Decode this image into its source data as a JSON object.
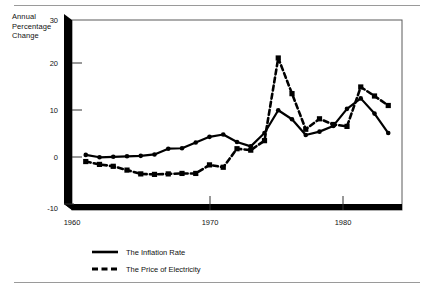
{
  "figure": {
    "axis_title_lines": [
      "Annual",
      "Percentage",
      "Change"
    ],
    "rule_color": "#9a9a9a",
    "ink_color": "#000000"
  },
  "chart_data": {
    "type": "line",
    "title": "",
    "subtitle": "",
    "xlabel": "",
    "ylabel": "Annual Percentage Change",
    "xlim": [
      1959,
      1983
    ],
    "ylim": [
      -10,
      30
    ],
    "xticks": [
      1960,
      1970,
      1980
    ],
    "xtick_labels": [
      "1960",
      "1970",
      "1980"
    ],
    "yticks": [
      -10,
      0,
      10,
      20,
      30
    ],
    "ytick_labels": [
      "-10",
      "0",
      "10",
      "20",
      "30"
    ],
    "grid": false,
    "legend_position": "below-left",
    "x": [
      1960,
      1961,
      1962,
      1963,
      1964,
      1965,
      1966,
      1967,
      1968,
      1969,
      1970,
      1971,
      1972,
      1973,
      1974,
      1975,
      1976,
      1977,
      1978,
      1979,
      1980,
      1981,
      1982
    ],
    "series": [
      {
        "name": "The Inflation Rate",
        "style": "solid",
        "marker": "circle",
        "color": "#000000",
        "values": [
          1.6,
          1.1,
          1.2,
          1.3,
          1.4,
          1.7,
          2.9,
          3.0,
          4.2,
          5.4,
          5.9,
          4.3,
          3.4,
          6.2,
          11.0,
          9.1,
          5.8,
          6.5,
          7.7,
          11.3,
          13.5,
          10.3,
          6.2
        ]
      },
      {
        "name": "The Price of Electricity",
        "style": "dashed",
        "marker": "square",
        "color": "#000000",
        "values": [
          0.2,
          -0.4,
          -0.8,
          -1.6,
          -2.4,
          -2.5,
          -2.4,
          -2.3,
          -2.3,
          -0.5,
          -1.0,
          2.9,
          2.6,
          4.6,
          22.0,
          14.5,
          7.0,
          9.2,
          8.0,
          7.6,
          15.9,
          14.0,
          12.0
        ]
      }
    ]
  },
  "legend": {
    "entries": [
      {
        "label": "The Inflation Rate",
        "style": "solid"
      },
      {
        "label": "The Price of Electricity",
        "style": "dashed"
      }
    ]
  }
}
